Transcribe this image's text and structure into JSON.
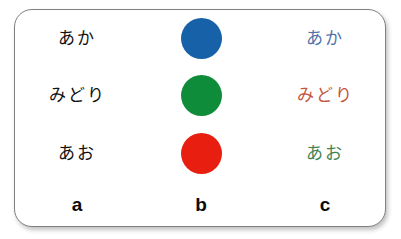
{
  "figure": {
    "caption_letters": [
      "a",
      "b",
      "c"
    ],
    "background_color": "#ffffff",
    "card_border_color": "#808080"
  },
  "columns": {
    "a": {
      "letter": "a",
      "description": "color words printed in black ink",
      "items": [
        {
          "text": "あか",
          "color": "#111111",
          "color_name": "black"
        },
        {
          "text": "みどり",
          "color": "#111111",
          "color_name": "black"
        },
        {
          "text": "あお",
          "color": "#111111",
          "color_name": "black"
        }
      ]
    },
    "b": {
      "letter": "b",
      "description": "solid color patches",
      "items": [
        {
          "shape": "circle",
          "color": "#1761a8",
          "color_name": "blue"
        },
        {
          "shape": "circle",
          "color": "#0e8c3a",
          "color_name": "green"
        },
        {
          "shape": "circle",
          "color": "#e81e11",
          "color_name": "red"
        }
      ]
    },
    "c": {
      "letter": "c",
      "description": "color words printed in mismatching ink colors",
      "items": [
        {
          "text": "あか",
          "color": "#4f73a8",
          "color_name": "blue"
        },
        {
          "text": "みどり",
          "color": "#c3563d",
          "color_name": "red"
        },
        {
          "text": "あお",
          "color": "#3e8355",
          "color_name": "green"
        }
      ]
    }
  }
}
